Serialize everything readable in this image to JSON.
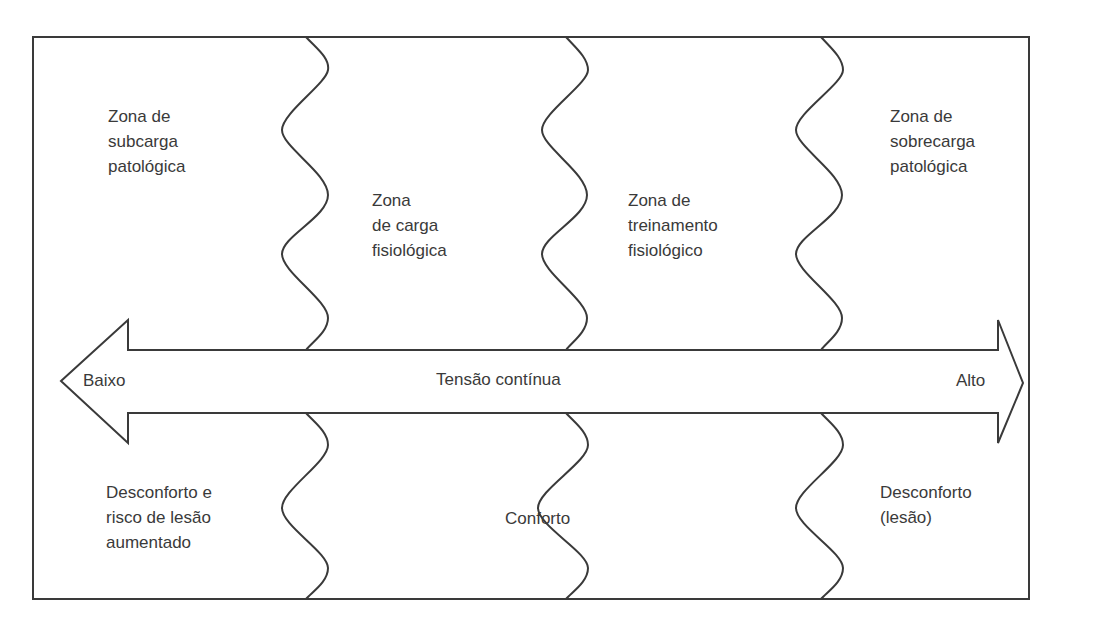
{
  "diagram": {
    "top_zones": [
      {
        "id": "subcarga",
        "lines": [
          "Zona de",
          "subcarga",
          "patológica"
        ]
      },
      {
        "id": "carga",
        "lines": [
          "Zona",
          "de carga",
          "fisiológica"
        ]
      },
      {
        "id": "treinamento",
        "lines": [
          "Zona de",
          "treinamento",
          "fisiológico"
        ]
      },
      {
        "id": "sobrecarga",
        "lines": [
          "Zona de",
          "sobrecarga",
          "patológica"
        ]
      }
    ],
    "arrow": {
      "left_label": "Baixo",
      "center_label": "Tensão contínua",
      "right_label": "Alto"
    },
    "bottom_zones": [
      {
        "id": "desconforto-risco",
        "lines": [
          "Desconforto e",
          "risco de lesão",
          "aumentado"
        ]
      },
      {
        "id": "conforto",
        "lines": [
          "Conforto"
        ]
      },
      {
        "id": "desconforto-lesao",
        "lines": [
          "Desconforto",
          "(lesão)"
        ]
      }
    ],
    "colors": {
      "line": "#3a3a3a",
      "text": "#3a3a3a",
      "background": "#ffffff"
    }
  }
}
